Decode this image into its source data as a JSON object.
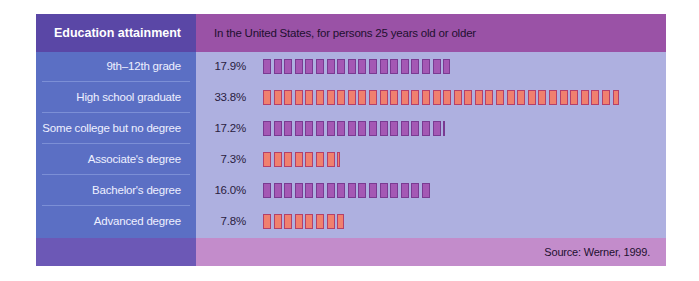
{
  "header": {
    "left_title": "Education attainment",
    "right_subtitle": "In the United States, for persons 25 years old or older"
  },
  "footer": {
    "source": "Source: Werner, 1999."
  },
  "colors": {
    "purple_bar_fill": "#a458b4",
    "purple_bar_border": "#7a3a92",
    "orange_bar_fill": "#f0806e",
    "orange_bar_border": "#b4406a"
  },
  "rows": [
    {
      "label": "9th–12th grade",
      "value_text": "17.9%",
      "value": 17.9,
      "color": "purple"
    },
    {
      "label": "High school graduate",
      "value_text": "33.8%",
      "value": 33.8,
      "color": "orange"
    },
    {
      "label": "Some college but no degree",
      "value_text": "17.2%",
      "value": 17.2,
      "color": "purple"
    },
    {
      "label": "Associate's degree",
      "value_text": "7.3%",
      "value": 7.3,
      "color": "orange"
    },
    {
      "label": "Bachelor's degree",
      "value_text": "16.0%",
      "value": 16.0,
      "color": "purple"
    },
    {
      "label": "Advanced degree",
      "value_text": "7.8%",
      "value": 7.8,
      "color": "orange"
    }
  ],
  "chart_data": {
    "type": "bar",
    "orientation": "horizontal",
    "title": "Education attainment",
    "subtitle": "In the United States, for persons 25 years old or older",
    "categories": [
      "9th–12th grade",
      "High school graduate",
      "Some college but no degree",
      "Associate's degree",
      "Bachelor's degree",
      "Advanced degree"
    ],
    "values": [
      17.9,
      33.8,
      17.2,
      7.3,
      16.0,
      7.8
    ],
    "unit": "%",
    "xlabel": "",
    "ylabel": "",
    "note": "Each bar is drawn as a row of unit boxes, one box per 1%",
    "source": "Source: Werner, 1999.",
    "grid": false,
    "legend": null
  }
}
